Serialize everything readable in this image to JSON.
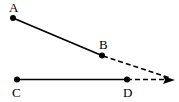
{
  "figure": {
    "type": "geometry-diagram",
    "width": 179,
    "height": 102,
    "background_color": "#ffffff",
    "stroke_color": "#000000",
    "points": [
      {
        "id": "A",
        "label": "A",
        "x": 13,
        "y": 18,
        "label_x": 9,
        "label_y": 2
      },
      {
        "id": "B",
        "label": "B",
        "x": 102,
        "y": 55,
        "label_x": 99,
        "label_y": 38
      },
      {
        "id": "C",
        "label": "C",
        "x": 17,
        "y": 79,
        "label_x": 12,
        "label_y": 86
      },
      {
        "id": "D",
        "label": "D",
        "x": 127,
        "y": 79,
        "label_x": 123,
        "label_y": 86
      }
    ],
    "arrow_tip": {
      "x": 174,
      "y": 80
    },
    "segments": [
      {
        "id": "AB",
        "from": "A",
        "to": "B",
        "style": "solid",
        "width": 1.6
      },
      {
        "id": "CD",
        "from": "C",
        "to": "D",
        "style": "solid",
        "width": 1.6
      }
    ],
    "rays": [
      {
        "id": "B-to-tip",
        "from": "B",
        "to": "arrow_tip",
        "style": "dashed",
        "dash": "5,3",
        "width": 1.6,
        "arrowhead": true
      },
      {
        "id": "D-to-tip",
        "from": "D",
        "to": "arrow_tip",
        "style": "dashed",
        "dash": "5,3",
        "width": 1.6,
        "arrowhead": true
      }
    ],
    "dot_radius": 3
  }
}
